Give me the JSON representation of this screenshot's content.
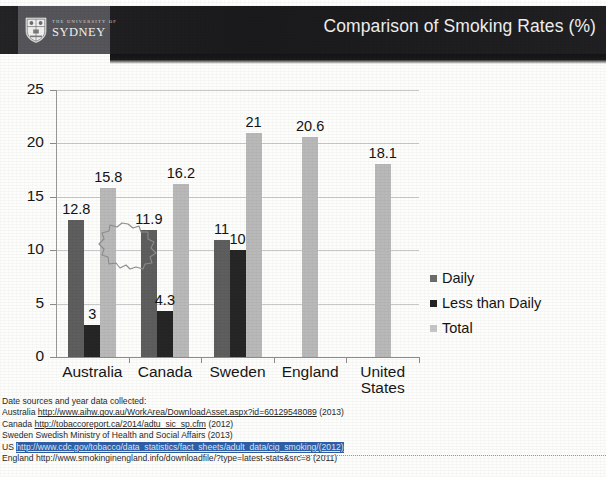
{
  "header": {
    "title": "Comparison of Smoking Rates (%)",
    "logo_university_line": "THE UNIVERSITY OF",
    "logo_name": "SYDNEY",
    "logo_icon": "sydney-crest-shield",
    "band_color": "#1c1c1e",
    "logo_block_color": "#55555a",
    "title_color": "#f0f0f0"
  },
  "chart_data": {
    "type": "bar",
    "title": "Comparison of Smoking Rates (%)",
    "xlabel": "",
    "ylabel": "",
    "ylim": [
      0,
      25
    ],
    "yticks": [
      0,
      5,
      10,
      15,
      20,
      25
    ],
    "grid": true,
    "legend_position": "right",
    "categories": [
      "Australia",
      "Canada",
      "Sweden",
      "England",
      "United States"
    ],
    "series": [
      {
        "name": "Daily",
        "color": "#5e5e5e",
        "values": [
          12.8,
          11.9,
          11,
          null,
          null
        ],
        "labels": [
          "12.8",
          "11.9",
          "11",
          "",
          ""
        ]
      },
      {
        "name": "Less than Daily",
        "color": "#262626",
        "values": [
          3,
          4.3,
          10,
          null,
          null
        ],
        "labels": [
          "3",
          "4.3",
          "10",
          "",
          ""
        ]
      },
      {
        "name": "Total",
        "color": "#b9b9b9",
        "values": [
          15.8,
          16.2,
          21,
          20.6,
          18.1
        ],
        "labels": [
          "15.8",
          "16.2",
          "21",
          "20.6",
          "18.1"
        ]
      }
    ],
    "annotations": [
      {
        "name": "starburst-callout",
        "target_series": "Total",
        "target_category": "Australia",
        "value": 15.8,
        "shape": "starburst"
      }
    ]
  },
  "legend": {
    "items": [
      {
        "label": "Daily",
        "color": "#6d6d6d"
      },
      {
        "label": "Less than Daily",
        "color": "#242424"
      },
      {
        "label": "Total",
        "color": "#c6c6c6"
      }
    ]
  },
  "sources": {
    "heading": "Date sources and year data collected:",
    "lines": [
      {
        "country": "Australia ",
        "url": "http://www.aihw.gov.au/WorkArea/DownloadAsset.aspx?id=60129548089",
        "year": " (2013)",
        "highlighted": false,
        "linked": true
      },
      {
        "country": "Canada ",
        "url": "http://tobaccoreport.ca/2014/adtu_sic_sp.cfm",
        "year": " (2012)",
        "highlighted": false,
        "linked": true
      },
      {
        "country": "Sweden ",
        "url": "Swedish Ministry of Health and Social Affairs",
        "year": " (2013)",
        "highlighted": false,
        "linked": false
      },
      {
        "country": "US ",
        "url": "http://www.cdc.gov/tobacco/data_statistics/fact_sheets/adult_data/cig_smoking/",
        "year": " (2012)",
        "highlighted": true,
        "linked": true
      },
      {
        "country": "England ",
        "url": "http://www.smokinginengland.info/downloadfile/?type=latest-stats&src=8",
        "year": " (2011)",
        "highlighted": false,
        "linked": false
      }
    ]
  }
}
